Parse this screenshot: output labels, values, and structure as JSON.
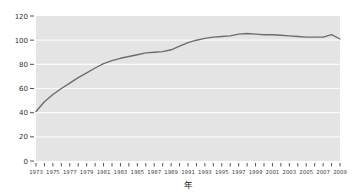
{
  "page": {
    "background_color": "#ffffff"
  },
  "chart_data": {
    "type": "line",
    "title": "",
    "xlabel": "年",
    "ylabel": "",
    "x": [
      1973,
      1974,
      1975,
      1976,
      1977,
      1978,
      1979,
      1980,
      1981,
      1982,
      1983,
      1984,
      1985,
      1986,
      1987,
      1988,
      1989,
      1990,
      1991,
      1992,
      1993,
      1994,
      1995,
      1996,
      1997,
      1998,
      1999,
      2000,
      2001,
      2002,
      2003,
      2004,
      2005,
      2006,
      2007,
      2008,
      2009
    ],
    "values": [
      41,
      49,
      55,
      60,
      64.5,
      69,
      73,
      77,
      80.5,
      83,
      85,
      86.5,
      88,
      89.5,
      90,
      90.5,
      92,
      95,
      98,
      100,
      101.5,
      102.5,
      103,
      103.5,
      105,
      105.5,
      105,
      104.5,
      104.5,
      104,
      103.5,
      103,
      102.5,
      102.5,
      102.5,
      104.5,
      101
    ],
    "ylim": [
      0,
      120
    ],
    "y_tick_step": 20,
    "y_tick_labels": [
      "0",
      "20",
      "40",
      "60",
      "80",
      "100",
      "120"
    ],
    "x_tick_every_year": true,
    "x_label_step_years": 2,
    "x_tick_labels": [
      "1973",
      "1975",
      "1977",
      "1979",
      "1981",
      "1983",
      "1985",
      "1987",
      "1989",
      "1991",
      "1993",
      "1995",
      "1997",
      "1999",
      "2001",
      "2003",
      "2005",
      "2007",
      "2009"
    ],
    "grid": "horizontal",
    "legend": "none",
    "colors": {
      "plot_background": "#e4e4e4",
      "gridline": "#fafafa",
      "line": "#6d6d6d",
      "tick": "#555555",
      "y_label_text": "#333333",
      "x_label_text": "#3d3d3d",
      "page_background": "#ffffff"
    }
  }
}
